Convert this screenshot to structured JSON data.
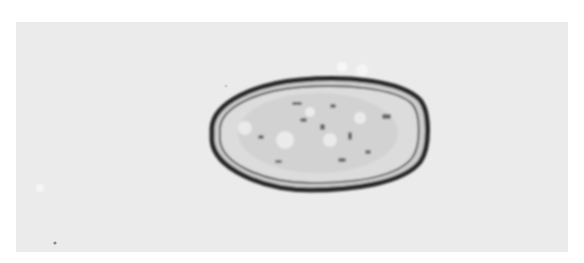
{
  "image": {
    "subject": "microscopy-egg",
    "description": "Brightfield micrograph of an oval egg with thick dark shell and granular interior on a light gray background",
    "colors": {
      "border": "#ffffff",
      "background": "#ebebeb",
      "shell": "#2e2e2e",
      "interior": "#d6d6d6"
    }
  }
}
